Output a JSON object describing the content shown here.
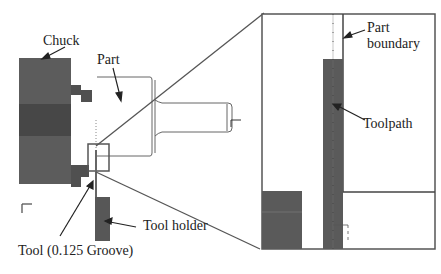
{
  "labels": {
    "chuck": "Chuck",
    "part": "Part",
    "part_boundary_line1": "Part",
    "part_boundary_line2": "boundary",
    "toolpath": "Toolpath",
    "tool_holder": "Tool holder",
    "tool": "Tool (0.125 Groove)"
  },
  "axis_glyphs": {
    "main_x": "x",
    "part_x": "x",
    "zoom_axis": "1"
  },
  "colors": {
    "chuck": "#5a5a5a",
    "chuck_dark": "#444444",
    "tool_holder": "#555555",
    "outline": "#555555",
    "background": "#ffffff",
    "text": "#222222"
  }
}
